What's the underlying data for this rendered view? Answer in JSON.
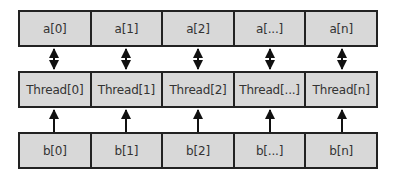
{
  "diagram": {
    "rows": [
      {
        "id": "a",
        "cells": [
          "a[0]",
          "a[1]",
          "a[2]",
          "a[...]",
          "a[n]"
        ]
      },
      {
        "id": "thread",
        "cells": [
          "Thread[0]",
          "Thread[1]",
          "Thread[2]",
          "Thread[...]",
          "Thread[n]"
        ]
      },
      {
        "id": "b",
        "cells": [
          "b[0]",
          "b[1]",
          "b[2]",
          "b[...]",
          "b[n]"
        ]
      }
    ],
    "connections": [
      {
        "from": "a",
        "to": "thread",
        "type": "bidirectional",
        "count": 5
      },
      {
        "from": "b",
        "to": "thread",
        "type": "unidirectional-up",
        "count": 5
      }
    ],
    "colors": {
      "cell_fill": "#d8d8d8",
      "border": "#222222",
      "text": "#333333",
      "arrow": "#111111"
    }
  }
}
